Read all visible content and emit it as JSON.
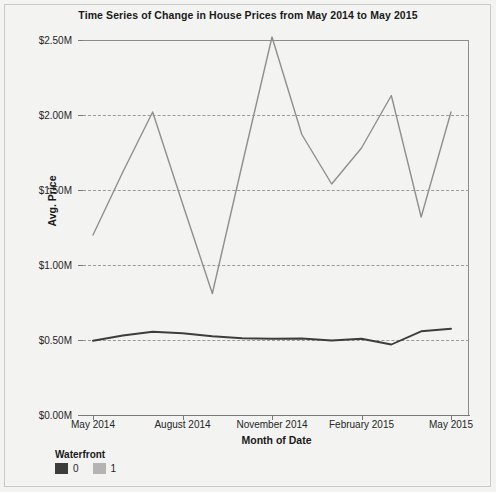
{
  "chart_data": {
    "type": "line",
    "title": "Time Series of Change in House Prices from May 2014 to May 2015",
    "xlabel": "Month of Date",
    "ylabel": "Avg. Price",
    "grid": true,
    "legend_position": "bottom-left",
    "legend_title": "Waterfront",
    "x": [
      "May 2014",
      "June 2014",
      "July 2014",
      "August 2014",
      "September 2014",
      "October 2014",
      "November 2014",
      "December 2014",
      "January 2015",
      "February 2015",
      "March 2015",
      "April 2015",
      "May 2015"
    ],
    "xticks": [
      "May 2014",
      "August 2014",
      "November 2014",
      "February 2015",
      "May 2015"
    ],
    "yticks": [
      "$0.00M",
      "$0.50M",
      "$1.00M",
      "$1.50M",
      "$2.00M",
      "$2.50M"
    ],
    "ytick_values": [
      0,
      0.5,
      1.0,
      1.5,
      2.0,
      2.5
    ],
    "ylim": [
      0,
      2.5
    ],
    "series": [
      {
        "name": "1",
        "color": "#8f8f8f",
        "values": [
          1.2,
          1.62,
          2.02,
          1.41,
          0.81,
          1.67,
          2.52,
          1.87,
          1.54,
          1.78,
          2.13,
          1.32,
          2.02
        ]
      },
      {
        "name": "0",
        "color": "#3d3d3d",
        "values": [
          0.495,
          0.53,
          0.555,
          0.545,
          0.525,
          0.512,
          0.508,
          0.51,
          0.497,
          0.508,
          0.47,
          0.558,
          0.575
        ]
      }
    ],
    "series_order_note": "Waterfront 0 drawn dark, Waterfront 1 drawn light gray"
  },
  "legend": {
    "title": "Waterfront",
    "items": [
      {
        "label": "0",
        "color": "#3d3d3d"
      },
      {
        "label": "1",
        "color": "#b4b4b4"
      }
    ]
  },
  "colors": {
    "background": "#f3f3f2",
    "frame": "#c9c9c9",
    "axis": "#7a7a7a",
    "grid": "#9a9a9a",
    "text": "#262626"
  }
}
